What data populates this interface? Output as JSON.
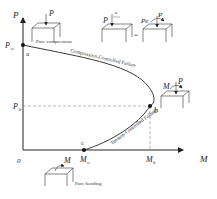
{
  "diagram": {
    "type": "P-M interaction diagram",
    "axes": {
      "y_label": "P",
      "x_label": "M",
      "origin": "0"
    },
    "points": {
      "a": {
        "label": "a",
        "axis_label": "P",
        "axis_sub": "o"
      },
      "b": {
        "label": "b",
        "p_label": "P",
        "p_sub": "b",
        "m_label": "M",
        "m_sub": "b"
      },
      "c": {
        "label": "c",
        "m_label": "M",
        "m_sub": "o"
      }
    },
    "regions": {
      "compression": "Compression-Controlled Failure",
      "tension": "Tension-Controlled Failure"
    },
    "insets": {
      "pure_compression": {
        "load": "P",
        "caption": "Pure compression"
      },
      "eccentric": {
        "left_load": "P",
        "ecc": "e",
        "equals": "=",
        "right_load": "Pe",
        "right_p": "P"
      },
      "balanced": {
        "moment": "M",
        "load": "P"
      },
      "pure_bending": {
        "moment": "M",
        "caption": "Pure bending"
      }
    },
    "colors": {
      "line": "#222222",
      "dashed": "#888888",
      "background": "#ffffff"
    }
  }
}
